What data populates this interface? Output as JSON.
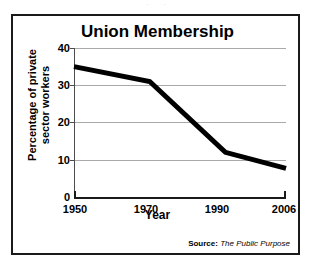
{
  "page": {
    "top_fragment": ". ."
  },
  "chart_data": {
    "type": "line",
    "title": "Union Membership",
    "xlabel": "Year",
    "ylabel": "Percentage of private sector workers",
    "ylabel_line1": "Percentage of private",
    "ylabel_line2": "sector workers",
    "categories": [
      "1950",
      "1970",
      "1990",
      "2006"
    ],
    "x": [
      1950,
      1970,
      1990,
      2006
    ],
    "values": [
      35,
      31,
      12,
      7.7
    ],
    "series": [
      {
        "name": "Union Membership",
        "values": [
          35,
          31,
          12,
          7.7
        ],
        "color": "#000000"
      }
    ],
    "xlim": [
      1950,
      2006
    ],
    "ylim": [
      0,
      40
    ],
    "yticks": [
      0,
      10,
      20,
      30,
      40
    ],
    "ytick_labels": [
      "0",
      "10",
      "20",
      "30",
      "40"
    ],
    "xtick_labels": [
      "1950",
      "1970",
      "1990",
      "2006"
    ],
    "grid": true,
    "grid_color": "#a9a9a9",
    "legend": false,
    "line_color": "#000000",
    "line_width": 5,
    "background": "#ffffff",
    "border_color": "#1a1a1a"
  },
  "source": {
    "label": "Source:",
    "name": "The Public Purpose"
  }
}
